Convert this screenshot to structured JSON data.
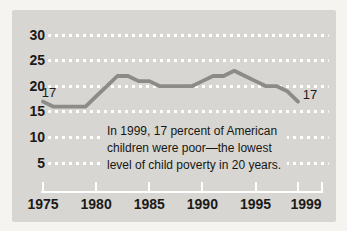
{
  "colors": {
    "page_bg": "#f6f4f0",
    "panel_bg": "#d8d6d2",
    "line": "#8d8b88",
    "grid": "#ffffff",
    "text": "#1b1a18"
  },
  "chart_data": {
    "type": "line",
    "x": [
      1975,
      1976,
      1977,
      1978,
      1979,
      1980,
      1981,
      1982,
      1983,
      1984,
      1985,
      1986,
      1987,
      1988,
      1989,
      1990,
      1991,
      1992,
      1993,
      1994,
      1995,
      1996,
      1997,
      1998,
      1999
    ],
    "values": [
      17,
      16,
      16,
      16,
      16,
      18,
      20,
      22,
      22,
      21,
      21,
      20,
      20,
      20,
      20,
      21,
      22,
      22,
      23,
      22,
      21,
      20,
      20,
      19,
      17
    ],
    "xticks": [
      1975,
      1980,
      1985,
      1990,
      1995,
      1999
    ],
    "yticks": [
      30,
      25,
      20,
      15,
      10,
      5
    ],
    "ylim": [
      0,
      32
    ],
    "xlabel": "",
    "ylabel": "",
    "grid": "horizontal-dotted-white",
    "legend": "none",
    "annotation_lines": [
      "In 1999, 17 percent of American",
      "children were poor—the lowest",
      "level of child poverty in 20 years."
    ],
    "point_labels": [
      {
        "year": 1975,
        "value": 17,
        "label": "17"
      },
      {
        "year": 1999,
        "value": 17,
        "label": "17"
      }
    ]
  }
}
